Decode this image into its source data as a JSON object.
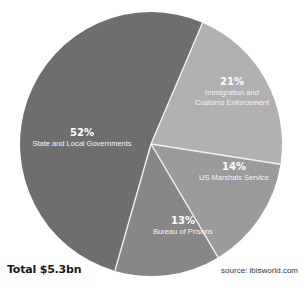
{
  "chart_data": {
    "type": "pie",
    "title": "",
    "categories": [
      "State and Local Governments",
      "Immigration and Customs Enforcement",
      "US Marshals Service",
      "Bureau of Prisons"
    ],
    "values": [
      52,
      21,
      14,
      13
    ],
    "unit": "%",
    "colors": [
      "#6e6e6e",
      "#b0b0b0",
      "#9b9b9b",
      "#878787"
    ],
    "slices": [
      {
        "pct_label": "52%",
        "name_lines": [
          "State and Local Governments"
        ],
        "value": 52,
        "color": "#6e6e6e"
      },
      {
        "pct_label": "21%",
        "name_lines": [
          "Immigration and",
          "Customs Enforcement"
        ],
        "value": 21,
        "color": "#b0b0b0"
      },
      {
        "pct_label": "14%",
        "name_lines": [
          "US Marshals Service"
        ],
        "value": 14,
        "color": "#9b9b9b"
      },
      {
        "pct_label": "13%",
        "name_lines": [
          "Bureau of Prisons"
        ],
        "value": 13,
        "color": "#878787"
      }
    ],
    "legend": "none (labels inside slices)",
    "total_label": "Total $5.3bn",
    "source": "source: ibisworld.com"
  },
  "footer": {
    "total": "Total $5.3bn",
    "source": "source: ibisworld.com"
  },
  "labels": {
    "s0_pct": "52%",
    "s0_name1": "State and Local Governments",
    "s1_pct": "21%",
    "s1_name1": "Immigration and",
    "s1_name2": "Customs Enforcement",
    "s2_pct": "14%",
    "s2_name1": "US Marshals Service",
    "s3_pct": "13%",
    "s3_name1": "Bureau of Prisons"
  }
}
